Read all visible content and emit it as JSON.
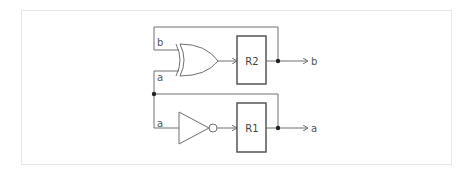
{
  "diagram": {
    "type": "logic-circuit",
    "registers": [
      {
        "id": "R2",
        "label": "R2"
      },
      {
        "id": "R1",
        "label": "R1"
      }
    ],
    "gates": [
      {
        "type": "XOR",
        "inputs": [
          "b",
          "a"
        ],
        "output_to": "R2"
      },
      {
        "type": "NOT",
        "inputs": [
          "a"
        ],
        "output_to": "R1"
      }
    ],
    "labels": {
      "xor_input_b": "b",
      "xor_input_a": "a",
      "not_input_a": "a",
      "output_b": "b",
      "output_a": "a"
    },
    "connections": [
      "R2 output -> b (feedback to XOR input b)",
      "R1 output -> a (feedback to XOR input a and NOT input)"
    ],
    "colors": {
      "wire": "#707070",
      "register_border": "#555555",
      "junction": "#222222",
      "panel_border": "#e6e6e6"
    }
  }
}
